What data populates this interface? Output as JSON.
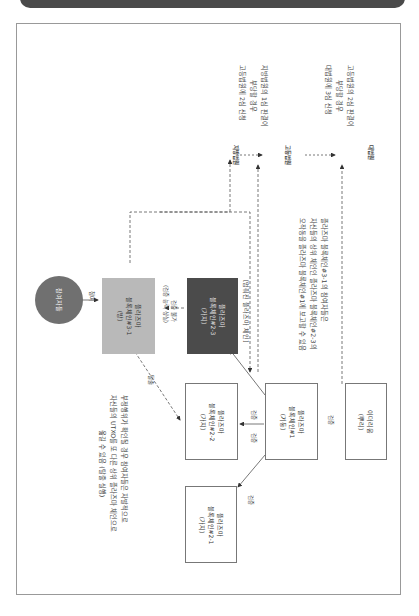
{
  "header": {
    "title": ""
  },
  "nodes": {
    "participant": {
      "label": "참여자들"
    },
    "chain3_1": {
      "line1": "플라즈마",
      "line2": "블록체인#3-1",
      "line3": "(방)"
    },
    "chain2_3": {
      "line1": "플라즈마",
      "line2": "블록체인#2-3",
      "line3": "(가지)"
    },
    "chain2_2": {
      "line1": "플라즈마",
      "line2": "블록체인#2-2",
      "line3": "(가지)"
    },
    "chain2_1": {
      "line1": "플라즈마",
      "line2": "블록체인#2-1",
      "line3": "(가지)"
    },
    "chain1": {
      "line1": "플라즈마",
      "line2": "블록체인#1",
      "line3": "(기둥)"
    },
    "ethereum": {
      "line1": "이더리움",
      "line2": "(뿌리)"
    },
    "district_court": {
      "label": "지방법원"
    },
    "high_court": {
      "label": "고등법원"
    },
    "supreme_court": {
      "label": "대법원"
    }
  },
  "edge_labels": {
    "participate": "참여",
    "verify_fail_1": "검증 불가",
    "verify_fail_2": "(검증 능력 상실)",
    "exit": "탈출",
    "verify_a": "검증",
    "verify_b": "검증",
    "verify_c": "검증",
    "verify_d": "검증"
  },
  "captions": {
    "stalled_chain": "[멈춰진 플라즈마 체인]",
    "district_appeal": [
      "지방법원의 1심 판결이",
      "부당할 경우",
      "고등법원에 2심 신청"
    ],
    "high_appeal": [
      "고등법원의 2심 판결이",
      "부당할 경우",
      "대법원에 3심 신청"
    ],
    "fraud_report": [
      "플라즈마 블록체인#3-1의 참여자들은",
      "자신들의 상위 체인인 플라즈마 블록체인#2-3의",
      "오작동을 플라즈마 블록체인#1에 보고할 수 있음"
    ],
    "exit_note": [
      "부정행위가 확인될 경우 참여자들은 자발적으로",
      "자신들의 UTXO를 또 다른 상위 플라즈마 체인으로",
      "옮길 수 있음 (탈출 실행)"
    ]
  },
  "colors": {
    "gray_box": "#b9b9b9",
    "dark_box": "#4b4b4b",
    "circle": "#707070",
    "line": "#555555"
  }
}
